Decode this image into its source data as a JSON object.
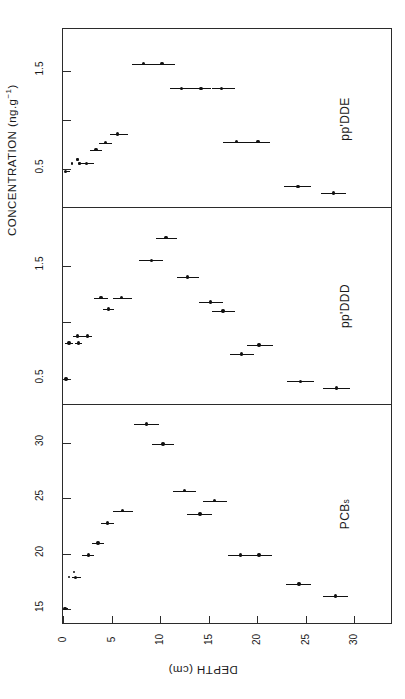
{
  "figure": {
    "y_axis_title_main": "CONCENTRATION (ng.g",
    "y_axis_title_exp": "−1",
    "y_axis_title_close": ")",
    "x_axis_title": "DEPTH (cm)",
    "orientation": "rotated-90",
    "frame_color": "#2b2b2b",
    "mark_color": "#111111",
    "background": "#ffffff"
  },
  "x_axis": {
    "label": "DEPTH (cm)",
    "unit": "cm",
    "min": 0,
    "max": 34,
    "ticks": [
      0,
      5,
      10,
      15,
      20,
      25,
      30
    ],
    "tick_labels": [
      "0",
      "5",
      "10",
      "15",
      "20",
      "25",
      "30"
    ]
  },
  "panels": [
    {
      "id": "ppDDE",
      "caption": "pp'DDE",
      "y_ticks": [
        0.5,
        1.0,
        1.5
      ],
      "y_tick_labels": [
        "0.5",
        "",
        "1.5"
      ],
      "y_min": 0.12,
      "y_max": 1.92
    },
    {
      "id": "ppDDD",
      "caption": "pp'DDD",
      "y_ticks": [
        0.5,
        1.0,
        1.5
      ],
      "y_tick_labels": [
        "0.5",
        "",
        "1.5"
      ],
      "y_min": 0.28,
      "y_max": 2.02
    },
    {
      "id": "PCBs",
      "caption_main": "PCB",
      "caption_sub": "s",
      "caption": "PCBs",
      "y_ticks": [
        15,
        20,
        25,
        30
      ],
      "y_tick_labels": [
        "15",
        "20",
        "25",
        "30"
      ],
      "y_min": 13.6,
      "y_max": 33.5
    }
  ],
  "chart_data": [
    {
      "type": "scatter",
      "title": "pp'DDE",
      "xlabel": "DEPTH (cm)",
      "ylabel": "CONCENTRATION (ng.g−1)",
      "xlim": [
        0,
        34
      ],
      "ylim": [
        0.12,
        1.92
      ],
      "grid": false,
      "legend": "none",
      "error_bars": "horizontal (depth interval of core slice)",
      "points": [
        {
          "x": 0.25,
          "y": 0.48,
          "xerr_lo": 0.0,
          "xerr_hi": 0.5
        },
        {
          "x": 0.9,
          "y": 0.56,
          "xerr_lo": 0.0,
          "xerr_hi": 0.0
        },
        {
          "x": 1.5,
          "y": 0.6,
          "xerr_lo": 0.0,
          "xerr_hi": 0.0
        },
        {
          "x": 1.7,
          "y": 0.56,
          "xerr_lo": 0.0,
          "xerr_hi": 0.0
        },
        {
          "x": 2.4,
          "y": 0.56,
          "xerr_lo": 0.5,
          "xerr_hi": 0.8
        },
        {
          "x": 3.4,
          "y": 0.7,
          "xerr_lo": 0.6,
          "xerr_hi": 0.6
        },
        {
          "x": 4.4,
          "y": 0.77,
          "xerr_lo": 0.7,
          "xerr_hi": 0.7
        },
        {
          "x": 5.6,
          "y": 0.86,
          "xerr_lo": 0.8,
          "xerr_hi": 1.1
        },
        {
          "x": 8.3,
          "y": 1.57,
          "xerr_lo": 1.2,
          "xerr_hi": 1.0
        },
        {
          "x": 10.2,
          "y": 1.57,
          "xerr_lo": 0.9,
          "xerr_hi": 1.3
        },
        {
          "x": 12.2,
          "y": 1.32,
          "xerr_lo": 1.2,
          "xerr_hi": 1.0
        },
        {
          "x": 14.2,
          "y": 1.32,
          "xerr_lo": 1.0,
          "xerr_hi": 1.0
        },
        {
          "x": 16.3,
          "y": 1.32,
          "xerr_lo": 1.0,
          "xerr_hi": 1.4
        },
        {
          "x": 17.9,
          "y": 0.78,
          "xerr_lo": 1.4,
          "xerr_hi": 1.2
        },
        {
          "x": 20.1,
          "y": 0.78,
          "xerr_lo": 1.1,
          "xerr_hi": 1.2
        },
        {
          "x": 24.2,
          "y": 0.33,
          "xerr_lo": 1.4,
          "xerr_hi": 1.4
        },
        {
          "x": 27.9,
          "y": 0.26,
          "xerr_lo": 1.3,
          "xerr_hi": 1.3
        }
      ]
    },
    {
      "type": "scatter",
      "title": "pp'DDD",
      "xlabel": "DEPTH (cm)",
      "ylabel": "CONCENTRATION (ng.g−1)",
      "xlim": [
        0,
        34
      ],
      "ylim": [
        0.28,
        2.02
      ],
      "grid": false,
      "legend": "none",
      "error_bars": "horizontal (depth interval of core slice)",
      "points": [
        {
          "x": 0.3,
          "y": 0.5,
          "xerr_lo": 0.0,
          "xerr_hi": 0.3
        },
        {
          "x": 0.6,
          "y": 0.82,
          "xerr_lo": 0.4,
          "xerr_hi": 0.4
        },
        {
          "x": 1.5,
          "y": 0.88,
          "xerr_lo": 0.5,
          "xerr_hi": 0.5
        },
        {
          "x": 1.6,
          "y": 0.82,
          "xerr_lo": 0.4,
          "xerr_hi": 0.4
        },
        {
          "x": 2.5,
          "y": 0.88,
          "xerr_lo": 0.5,
          "xerr_hi": 0.5
        },
        {
          "x": 3.9,
          "y": 1.22,
          "xerr_lo": 0.7,
          "xerr_hi": 0.7
        },
        {
          "x": 4.7,
          "y": 1.12,
          "xerr_lo": 0.6,
          "xerr_hi": 0.6
        },
        {
          "x": 6.0,
          "y": 1.22,
          "xerr_lo": 0.9,
          "xerr_hi": 1.1
        },
        {
          "x": 9.1,
          "y": 1.55,
          "xerr_lo": 1.3,
          "xerr_hi": 1.2
        },
        {
          "x": 10.6,
          "y": 1.75,
          "xerr_lo": 1.0,
          "xerr_hi": 1.1
        },
        {
          "x": 12.8,
          "y": 1.4,
          "xerr_lo": 1.1,
          "xerr_hi": 1.2
        },
        {
          "x": 15.2,
          "y": 1.18,
          "xerr_lo": 1.2,
          "xerr_hi": 1.3
        },
        {
          "x": 16.5,
          "y": 1.1,
          "xerr_lo": 1.2,
          "xerr_hi": 1.2
        },
        {
          "x": 18.4,
          "y": 0.72,
          "xerr_lo": 1.2,
          "xerr_hi": 1.3
        },
        {
          "x": 20.2,
          "y": 0.8,
          "xerr_lo": 1.2,
          "xerr_hi": 1.4
        },
        {
          "x": 24.5,
          "y": 0.48,
          "xerr_lo": 1.4,
          "xerr_hi": 1.4
        },
        {
          "x": 28.2,
          "y": 0.42,
          "xerr_lo": 1.4,
          "xerr_hi": 1.4
        }
      ]
    },
    {
      "type": "scatter",
      "title": "PCBs",
      "xlabel": "DEPTH (cm)",
      "ylabel": "CONCENTRATION (ng.g−1)",
      "xlim": [
        0,
        34
      ],
      "ylim": [
        13.6,
        33.5
      ],
      "grid": false,
      "legend": "none",
      "error_bars": "horizontal (depth interval of core slice)",
      "points": [
        {
          "x": 0.2,
          "y": 15.1,
          "xerr_lo": 0.0,
          "xerr_hi": 0.3
        },
        {
          "x": 0.6,
          "y": 17.9,
          "xerr_lo": 0.0,
          "xerr_hi": 0.0
        },
        {
          "x": 1.3,
          "y": 17.9,
          "xerr_lo": 0.4,
          "xerr_hi": 0.6
        },
        {
          "x": 1.1,
          "y": 18.4,
          "xerr_lo": 0.0,
          "xerr_hi": 0.0
        },
        {
          "x": 2.6,
          "y": 19.9,
          "xerr_lo": 0.6,
          "xerr_hi": 0.6
        },
        {
          "x": 3.6,
          "y": 21.0,
          "xerr_lo": 0.6,
          "xerr_hi": 0.6
        },
        {
          "x": 4.6,
          "y": 22.8,
          "xerr_lo": 0.7,
          "xerr_hi": 0.7
        },
        {
          "x": 6.1,
          "y": 23.9,
          "xerr_lo": 0.9,
          "xerr_hi": 1.1
        },
        {
          "x": 8.6,
          "y": 31.7,
          "xerr_lo": 1.3,
          "xerr_hi": 1.3
        },
        {
          "x": 10.3,
          "y": 29.9,
          "xerr_lo": 1.1,
          "xerr_hi": 1.1
        },
        {
          "x": 12.5,
          "y": 25.7,
          "xerr_lo": 1.2,
          "xerr_hi": 1.2
        },
        {
          "x": 14.1,
          "y": 23.6,
          "xerr_lo": 1.3,
          "xerr_hi": 1.3
        },
        {
          "x": 15.6,
          "y": 24.8,
          "xerr_lo": 1.2,
          "xerr_hi": 1.3
        },
        {
          "x": 18.3,
          "y": 19.9,
          "xerr_lo": 1.3,
          "xerr_hi": 1.2
        },
        {
          "x": 20.2,
          "y": 19.9,
          "xerr_lo": 1.1,
          "xerr_hi": 1.3
        },
        {
          "x": 24.3,
          "y": 17.3,
          "xerr_lo": 1.3,
          "xerr_hi": 1.3
        },
        {
          "x": 28.1,
          "y": 16.2,
          "xerr_lo": 1.3,
          "xerr_hi": 1.3
        }
      ]
    }
  ]
}
